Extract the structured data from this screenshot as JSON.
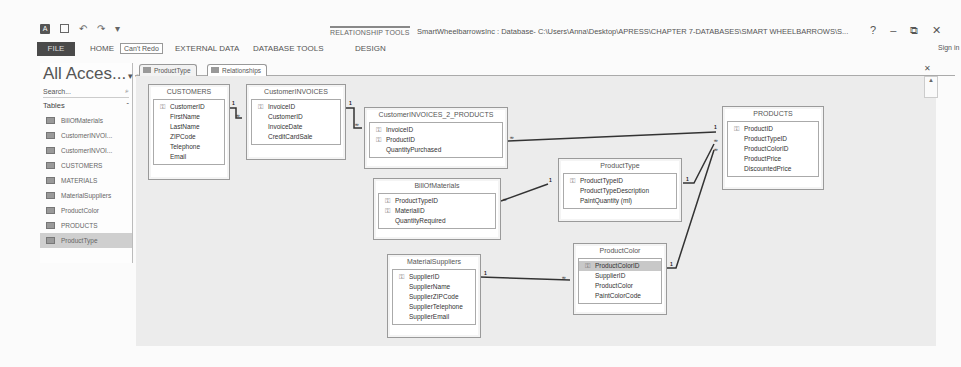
{
  "window": {
    "context_tab_label": "RELATIONSHIP TOOLS",
    "title": "SmartWheelbarrowsInc : Database- C:\\Users\\Anna\\Desktop\\APRESS\\CHAPTER 7-DATABASES\\SMART WHEELBARROWS\\S...",
    "controls": {
      "help": "?",
      "minimize": "–",
      "restore": "⧉",
      "close": "✕"
    },
    "sign_in": "Sign in"
  },
  "quick_access": {
    "app_icon": "A",
    "undo": "↶",
    "redo": "↷",
    "customize": "▾"
  },
  "ribbon": {
    "file": "FILE",
    "tabs": [
      "HOME",
      "CREATE",
      "EXTERNAL DATA",
      "DATABASE TOOLS",
      "DESIGN"
    ],
    "tooltip": "Can't Redo"
  },
  "nav_pane": {
    "title": "All Acces...",
    "search_placeholder": "Search...",
    "group": "Tables",
    "group_toggle": "«",
    "items": [
      {
        "label": "BillOfMaterials",
        "selected": false
      },
      {
        "label": "CustomerINVOI...",
        "selected": false
      },
      {
        "label": "CustomerINVOI...",
        "selected": false
      },
      {
        "label": "CUSTOMERS",
        "selected": false
      },
      {
        "label": "MATERIALS",
        "selected": false
      },
      {
        "label": "MaterialSuppliers",
        "selected": false
      },
      {
        "label": "ProductColor",
        "selected": false
      },
      {
        "label": "PRODUCTS",
        "selected": false
      },
      {
        "label": "ProductType",
        "selected": true
      }
    ]
  },
  "document_tabs": [
    {
      "label": "ProductType",
      "active": false
    },
    {
      "label": "Relationships",
      "active": true
    }
  ],
  "tables": {
    "customers": {
      "name": "CUSTOMERS",
      "fields": [
        {
          "name": "CustomerID",
          "key": true
        },
        {
          "name": "FirstName"
        },
        {
          "name": "LastName"
        },
        {
          "name": "ZIPCode"
        },
        {
          "name": "Telephone"
        },
        {
          "name": "Email"
        }
      ]
    },
    "customer_invoices": {
      "name": "CustomerINVOICES",
      "fields": [
        {
          "name": "InvoiceID",
          "key": true
        },
        {
          "name": "CustomerID"
        },
        {
          "name": "InvoiceDate"
        },
        {
          "name": "CreditCardSale"
        }
      ]
    },
    "invoices_products": {
      "name": "CustomerINVOICES_2_PRODUCTS",
      "fields": [
        {
          "name": "InvoiceID",
          "key": true
        },
        {
          "name": "ProductID",
          "key": true
        },
        {
          "name": "QuantityPurchased"
        }
      ]
    },
    "bill_of_materials": {
      "name": "BillOfMaterials",
      "fields": [
        {
          "name": "ProductTypeID",
          "key": true
        },
        {
          "name": "MaterialID",
          "key": true
        },
        {
          "name": "QuantityRequired"
        }
      ]
    },
    "material_suppliers": {
      "name": "MaterialSuppliers",
      "fields": [
        {
          "name": "SupplierID",
          "key": true
        },
        {
          "name": "SupplierName"
        },
        {
          "name": "SupplierZIPCode"
        },
        {
          "name": "SupplierTelephone"
        },
        {
          "name": "SupplierEmail"
        }
      ]
    },
    "product_type": {
      "name": "ProductType",
      "fields": [
        {
          "name": "ProductTypeID",
          "key": true
        },
        {
          "name": "ProductTypeDescription"
        },
        {
          "name": "PaintQuantity (ml)"
        }
      ]
    },
    "product_color": {
      "name": "ProductColor",
      "fields": [
        {
          "name": "ProductColorID",
          "key": true,
          "highlighted": true
        },
        {
          "name": "SupplierID"
        },
        {
          "name": "ProductColor"
        },
        {
          "name": "PaintColorCode"
        }
      ]
    },
    "products": {
      "name": "PRODUCTS",
      "fields": [
        {
          "name": "ProductID",
          "key": true
        },
        {
          "name": "ProductTypeID"
        },
        {
          "name": "ProductColorID"
        },
        {
          "name": "ProductPrice"
        },
        {
          "name": "DiscountedPrice"
        }
      ]
    }
  },
  "relationship_labels": {
    "one": "1",
    "many": "∞"
  },
  "icons": {
    "key": "⚿",
    "search": "⌕",
    "chevron": "▾",
    "close": "✕",
    "scroll_up": "▲"
  }
}
